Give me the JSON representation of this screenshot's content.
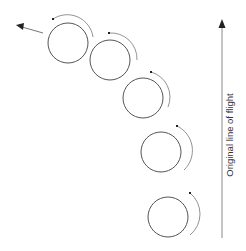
{
  "diagram": {
    "label": "Original line of flight",
    "colors": {
      "circle_stroke": "#555555",
      "arc_stroke": "#777777",
      "axis_stroke": "#888888",
      "arrowhead": "#222222",
      "background": "#ffffff"
    },
    "balls": [
      {
        "cx": 68,
        "cy": 43,
        "r": 20
      },
      {
        "cx": 110,
        "cy": 60,
        "r": 20
      },
      {
        "cx": 143,
        "cy": 98,
        "r": 20
      },
      {
        "cx": 161,
        "cy": 152,
        "r": 20
      },
      {
        "cx": 168,
        "cy": 217,
        "r": 20
      }
    ],
    "spin_arcs_direction": "counterclockwise",
    "curved_path_direction": "up and to the left",
    "axis_arrow_direction": "up"
  }
}
